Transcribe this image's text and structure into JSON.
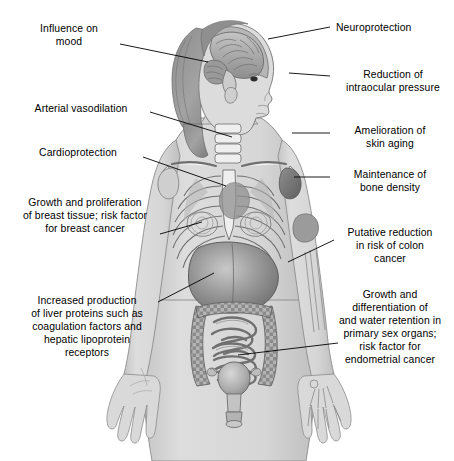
{
  "diagram": {
    "type": "anatomical-annotated-figure",
    "background_color": "#ffffff",
    "line_color": "#000000",
    "text_color": "#000000",
    "palette": {
      "skin": "#d9d9d9",
      "skin_shadow": "#bfbfbf",
      "hair": "#9a9a9a",
      "hair_dark": "#7c7c7c",
      "bone": "#f2f2f2",
      "bone_outline": "#6b6b6b",
      "brain": "#b8b8b8",
      "organ_dark": "#737373",
      "organ_mid": "#9e9e9e",
      "liver": "#8a8a8a",
      "intestine": "#a5a5a5",
      "uterus": "#c0c0c0"
    },
    "labels": [
      {
        "id": "influence-on-mood",
        "side": "left",
        "text": "Influence on\nmood",
        "target": "brain",
        "text_x": 20,
        "text_y": 22,
        "text_w": 98,
        "leader": [
          [
            120,
            44
          ],
          [
            208,
            62
          ]
        ]
      },
      {
        "id": "arterial-vasodilation",
        "side": "left",
        "text": "Arterial vasodilation",
        "target": "carotid artery / neck vessels",
        "text_x": 16,
        "text_y": 102,
        "text_w": 130,
        "leader": [
          [
            150,
            112
          ],
          [
            232,
            137
          ]
        ]
      },
      {
        "id": "cardioprotection",
        "side": "left",
        "text": "Cardioprotection",
        "target": "heart",
        "text_x": 18,
        "text_y": 146,
        "text_w": 120,
        "leader": [
          [
            143,
            157
          ],
          [
            226,
            186
          ]
        ]
      },
      {
        "id": "breast-growth",
        "side": "left",
        "text": "Growth and proliferation\nof breast tissue; risk factor\nfor breast cancer",
        "target": "breast",
        "text_x": 12,
        "text_y": 196,
        "text_w": 146,
        "leader": [
          [
            160,
            234
          ],
          [
            202,
            222
          ]
        ]
      },
      {
        "id": "liver-proteins",
        "side": "left",
        "text": "Increased production\nof liver proteins such as\ncoagulation factors and\nhepatic lipoprotein\nreceptors",
        "target": "liver",
        "text_x": 16,
        "text_y": 294,
        "text_w": 142,
        "leader": [
          [
            158,
            302
          ],
          [
            214,
            273
          ]
        ]
      },
      {
        "id": "neuroprotection",
        "side": "right",
        "text": "Neuroprotection",
        "target": "brain / cerebral cortex",
        "text_x": 336,
        "text_y": 21,
        "text_w": 110,
        "leader": [
          [
            268,
            39
          ],
          [
            330,
            27
          ]
        ]
      },
      {
        "id": "intraocular-pressure",
        "side": "right",
        "text": "Reduction of\nintraocular pressure",
        "target": "eye",
        "text_x": 334,
        "text_y": 68,
        "text_w": 118,
        "leader": [
          [
            289,
            73
          ],
          [
            330,
            76
          ]
        ]
      },
      {
        "id": "skin-aging",
        "side": "right",
        "text": "Amelioration of\nskin aging",
        "target": "skin of shoulder / upper arm",
        "text_x": 334,
        "text_y": 124,
        "text_w": 112,
        "leader": [
          [
            292,
            133
          ],
          [
            330,
            133
          ]
        ]
      },
      {
        "id": "bone-density",
        "side": "right",
        "text": "Maintenance of\nbone density",
        "target": "humerus / shoulder bone",
        "text_x": 334,
        "text_y": 168,
        "text_w": 112,
        "leader": [
          [
            294,
            177
          ],
          [
            330,
            177
          ]
        ]
      },
      {
        "id": "colon-cancer",
        "side": "right",
        "text": "Putative reduction\nin risk of colon\ncancer",
        "target": "colon",
        "text_x": 334,
        "text_y": 226,
        "text_w": 112,
        "leader": [
          [
            288,
            262
          ],
          [
            334,
            240
          ]
        ]
      },
      {
        "id": "sex-organs",
        "side": "right",
        "text": "Growth and\ndifferentiation of\nand water retention in\nprimary sex organs;\nrisk factor for\nendometrial cancer",
        "target": "uterus / primary sex organs",
        "text_x": 330,
        "text_y": 288,
        "text_w": 120,
        "leader": [
          [
            238,
            355
          ],
          [
            338,
            343
          ]
        ]
      }
    ]
  }
}
